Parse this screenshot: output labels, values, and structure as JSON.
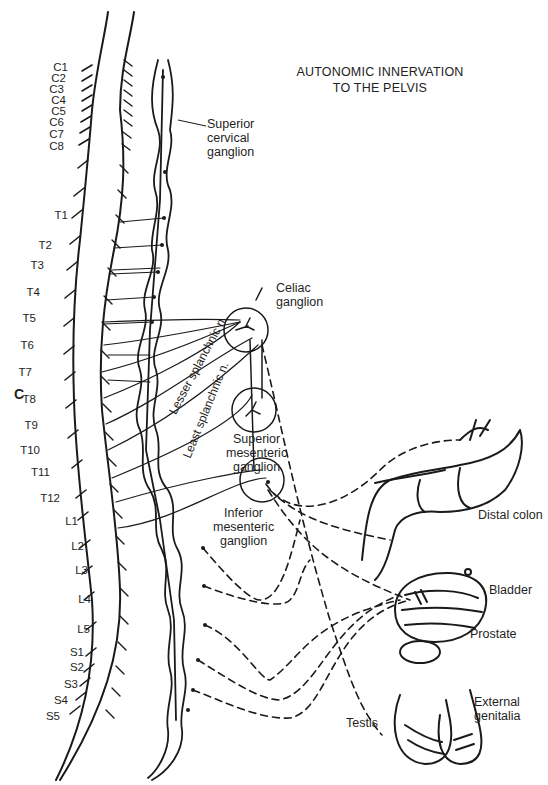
{
  "title": {
    "line1": "AUTONOMIC INNERVATION",
    "line2": "TO THE PELVIS"
  },
  "panel_label": "C",
  "spinal_segments": {
    "cervical": [
      "C1",
      "C2",
      "C3",
      "C4",
      "C5",
      "C6",
      "C7",
      "C8"
    ],
    "thoracic": [
      "T1",
      "T2",
      "T3",
      "T4",
      "T5",
      "T6",
      "T7",
      "T8",
      "T9",
      "T10",
      "T11",
      "T12"
    ],
    "lumbar": [
      "L1",
      "L2",
      "L3",
      "L4",
      "L5"
    ],
    "sacral": [
      "S1",
      "S2",
      "S3",
      "S4",
      "S5"
    ]
  },
  "ganglia": {
    "superior_cervical": [
      "Superior",
      "cervical",
      "ganglion"
    ],
    "celiac": [
      "Celiac",
      "ganglion"
    ],
    "superior_mesenteric": [
      "Superior",
      "mesenteric",
      "ganglion"
    ],
    "inferior_mesenteric": [
      "Inferior",
      "mesenteric",
      "ganglion"
    ]
  },
  "nerves": {
    "lesser_splanchnic": "Lesser splanchnic n.",
    "least_splanchnic": "Least splanchnic n."
  },
  "organs": {
    "distal_colon": "Distal colon",
    "bladder": "Bladder",
    "prostate": "Prostate",
    "testis": "Testis",
    "external_genitalia": [
      "External",
      "genitalia"
    ]
  },
  "colors": {
    "ink": "#1a1a1a",
    "background": "#ffffff"
  }
}
